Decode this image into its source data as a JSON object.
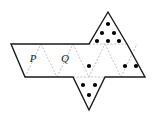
{
  "figure": {
    "type": "geometric-net",
    "stroke_color": "#1a1a1a",
    "fold_line_color": "#b0b0b0",
    "dot_color": "#000000",
    "background": "#ffffff",
    "solid_stroke_width": 1.4,
    "fold_stroke_width": 0.8,
    "dot_radius": 2.1,
    "labels": [
      {
        "text": "P",
        "x": 33,
        "y": 62
      },
      {
        "text": "Q",
        "x": 65,
        "y": 62
      }
    ],
    "outline_points": "11,44 89,44 108,12 127,44 145,77 105,77 89,110 73,77 25,77",
    "fold_lines": [
      {
        "name": "fold-p-right",
        "x1": 25,
        "y1": 77,
        "x2": 41,
        "y2": 44
      },
      {
        "name": "fold-q-left",
        "x1": 41,
        "y1": 44,
        "x2": 57,
        "y2": 77
      },
      {
        "name": "fold-q-right",
        "x1": 57,
        "y1": 77,
        "x2": 73,
        "y2": 44
      },
      {
        "name": "fold-mid-left",
        "x1": 73,
        "y1": 44,
        "x2": 89,
        "y2": 77
      },
      {
        "name": "fold-mid-right",
        "x1": 89,
        "y1": 77,
        "x2": 105,
        "y2": 44
      },
      {
        "name": "fold-right",
        "x1": 105,
        "y1": 44,
        "x2": 121,
        "y2": 77
      },
      {
        "name": "fold-far-right",
        "x1": 121,
        "y1": 77,
        "x2": 137,
        "y2": 44
      },
      {
        "name": "fold-top-base",
        "x1": 89,
        "y1": 44,
        "x2": 127,
        "y2": 44
      },
      {
        "name": "fold-bottom-base",
        "x1": 73,
        "y1": 77,
        "x2": 105,
        "y2": 77
      }
    ],
    "faces": [
      {
        "name": "face-p",
        "label": "P",
        "dot_count": 0,
        "dots": []
      },
      {
        "name": "face-q",
        "label": "Q",
        "dot_count": 0,
        "dots": []
      },
      {
        "name": "face-top",
        "label": "",
        "dot_count": 6,
        "dots": [
          {
            "cx": 108,
            "cy": 24
          },
          {
            "cx": 102,
            "cy": 33
          },
          {
            "cx": 114,
            "cy": 33
          },
          {
            "cx": 97,
            "cy": 41
          },
          {
            "cx": 108,
            "cy": 41
          },
          {
            "cx": 119,
            "cy": 41
          }
        ]
      },
      {
        "name": "face-center",
        "label": "",
        "dot_count": 1,
        "dots": [
          {
            "cx": 89,
            "cy": 66
          }
        ]
      },
      {
        "name": "face-right",
        "label": "",
        "dot_count": 2,
        "dots": [
          {
            "cx": 125,
            "cy": 66
          },
          {
            "cx": 136,
            "cy": 66
          }
        ]
      },
      {
        "name": "face-bottom",
        "label": "",
        "dot_count": 3,
        "dots": [
          {
            "cx": 83,
            "cy": 85
          },
          {
            "cx": 95,
            "cy": 85
          },
          {
            "cx": 89,
            "cy": 95
          }
        ]
      }
    ]
  }
}
